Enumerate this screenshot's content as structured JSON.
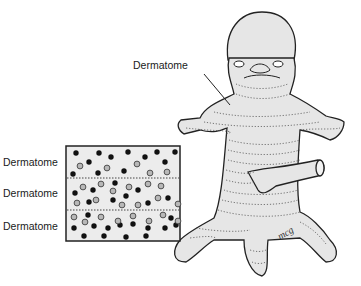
{
  "labels": {
    "embryo_pointer": "Dermatome",
    "box_rows": [
      "Dermatome",
      "Dermatome",
      "Dermatome"
    ]
  },
  "signature": "mcg",
  "colors": {
    "body_fill": "#e6e6e6",
    "outline": "#222222",
    "dot_dark": "#111111",
    "dot_light": "#b8b8b8",
    "box_fill": "#ececec"
  }
}
